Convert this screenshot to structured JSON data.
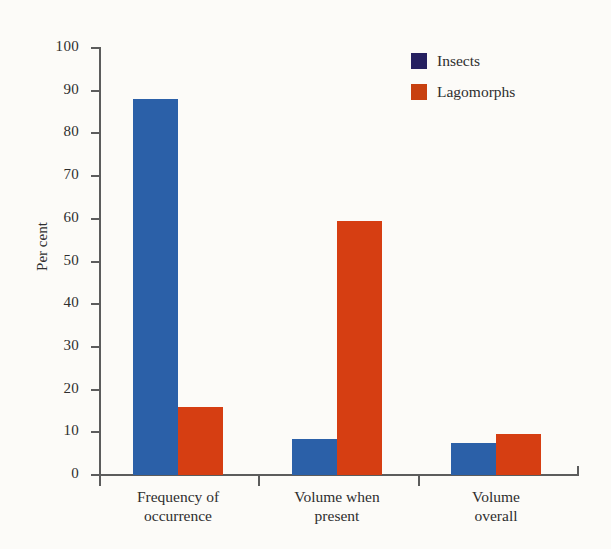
{
  "chart_data": {
    "type": "bar",
    "title": "",
    "xlabel": "",
    "ylabel": "Per cent",
    "ylim": [
      0,
      100
    ],
    "ytick_step": 10,
    "yticks": [
      0,
      10,
      20,
      30,
      40,
      50,
      60,
      70,
      80,
      90,
      100
    ],
    "grid": false,
    "legend_position": "top-right",
    "categories": [
      "Frequency of occurrence",
      "Volume when present",
      "Volume overall"
    ],
    "category_lines": [
      [
        "Frequency of",
        "occurrence"
      ],
      [
        "Volume when",
        "present"
      ],
      [
        "Volume",
        "overall"
      ]
    ],
    "series": [
      {
        "name": "Insects",
        "color": "#2b60a8",
        "legend_color": "#252060",
        "values": [
          88,
          8.5,
          7.5
        ]
      },
      {
        "name": "Lagomorphs",
        "color": "#d63e12",
        "legend_color": "#c8400f",
        "values": [
          16,
          59.5,
          9.5
        ]
      }
    ]
  },
  "legend": {
    "items": [
      {
        "label": "Insects",
        "color": "#252060"
      },
      {
        "label": "Lagomorphs",
        "color": "#c8400f"
      }
    ]
  }
}
